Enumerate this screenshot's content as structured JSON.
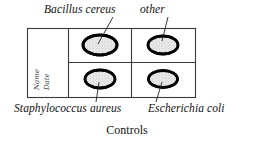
{
  "figure": {
    "caption": "Controls",
    "background_color": "#ffffff",
    "line_color": "#333333",
    "colony_outline_color": "#000000",
    "colony_fill_color": "#e8e8e8"
  },
  "plate": {
    "label_column": {
      "name_field": "Name",
      "date_field": "Date"
    },
    "quadrants": [
      {
        "position": "top-left",
        "label": "Bacillus cereus",
        "has_colony": true
      },
      {
        "position": "top-right",
        "label": "other",
        "has_colony": true
      },
      {
        "position": "bottom-left",
        "label": "Staphylococcus aureus",
        "has_colony": true
      },
      {
        "position": "bottom-right",
        "label": "Escherichia coli",
        "has_colony": true
      }
    ]
  }
}
